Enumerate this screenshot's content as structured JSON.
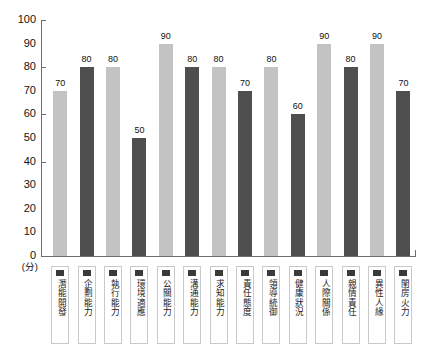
{
  "chart_data": {
    "type": "bar",
    "title": "",
    "xlabel": "",
    "ylabel": "(分)",
    "ylim": [
      0,
      100
    ],
    "ystep": 10,
    "grid": false,
    "legend": "none",
    "tick_labels": [
      "0",
      "10",
      "20",
      "30",
      "40",
      "50",
      "60",
      "70",
      "80",
      "90",
      "100"
    ],
    "major_ticks": [
      40,
      60,
      80,
      100
    ],
    "categories": [
      "潛能開發",
      "企劃能力",
      "執行能力",
      "環境適應",
      "公關能力",
      "溝通能力",
      "求知能力",
      "責任態度",
      "領導統御",
      "健康狀況",
      "人際關係",
      "親情責任",
      "異性人緣",
      "閨房火力"
    ],
    "values": [
      70,
      80,
      80,
      50,
      90,
      80,
      80,
      70,
      80,
      60,
      90,
      80,
      90,
      70
    ],
    "value_labels": [
      "70",
      "80",
      "80",
      "50",
      "90",
      "80",
      "80",
      "70",
      "80",
      "60",
      "90",
      "80",
      "90",
      "70"
    ],
    "bar_colors": [
      "#c3c3c3",
      "#4f4f4f",
      "#c3c3c3",
      "#4f4f4f",
      "#c3c3c3",
      "#4f4f4f",
      "#c3c3c3",
      "#4f4f4f",
      "#c3c3c3",
      "#4f4f4f",
      "#c3c3c3",
      "#4f4f4f",
      "#c3c3c3",
      "#4f4f4f"
    ],
    "colors": {
      "light_bar": "#c3c3c3",
      "dark_bar": "#4f4f4f",
      "axis": "#6e6e6e",
      "text": "#111111",
      "swatch": "#3a3a3a",
      "background": "#ffffff"
    }
  }
}
